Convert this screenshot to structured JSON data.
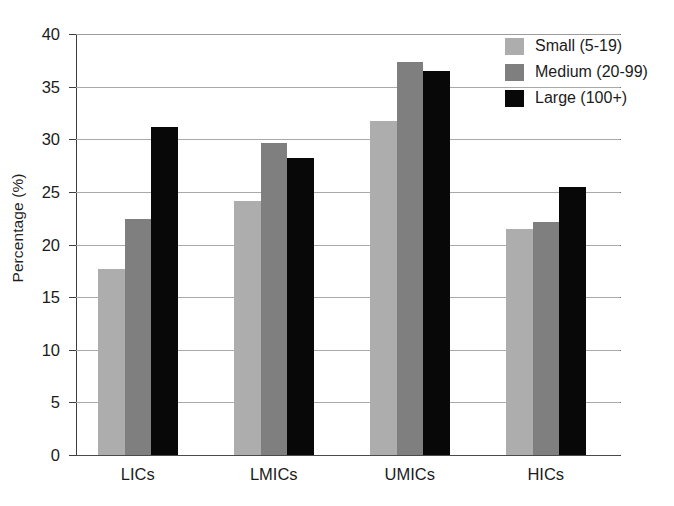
{
  "chart_data": {
    "type": "bar",
    "title": "",
    "subtitle": "",
    "xlabel": "",
    "ylabel": "Percentage (%)",
    "categories": [
      "LICs",
      "LMICs",
      "UMICs",
      "HICs"
    ],
    "series": [
      {
        "name": "Small (5-19)",
        "color": "#adadad",
        "values": [
          17.7,
          24.1,
          31.7,
          21.5
        ]
      },
      {
        "name": "Medium (20-99)",
        "color": "#7f7f7f",
        "values": [
          22.4,
          29.6,
          37.3,
          22.1
        ]
      },
      {
        "name": "Large (100+)",
        "color": "#080808",
        "values": [
          31.2,
          28.2,
          36.5,
          25.5
        ]
      }
    ],
    "ylim": [
      0,
      40
    ],
    "ytick_values": [
      0,
      5,
      10,
      15,
      20,
      25,
      30,
      35,
      40
    ],
    "ytick_labels": [
      "0",
      "5",
      "10",
      "15",
      "20",
      "25",
      "30",
      "35",
      "40"
    ],
    "grid": "horizontal",
    "legend_position": "top-right",
    "annotations": []
  },
  "legend": {
    "entries": [
      {
        "label": "Small (5-19)",
        "swatch": "legend-swatch-small"
      },
      {
        "label": "Medium (20-99)",
        "swatch": "legend-swatch-medium"
      },
      {
        "label": "Large (100+)",
        "swatch": "legend-swatch-large"
      }
    ]
  },
  "axes": {
    "y_title": "Percentage (%)",
    "y_ticks": [
      "40",
      "35",
      "30",
      "25",
      "20",
      "15",
      "10",
      "5",
      "0"
    ],
    "x_ticks": [
      "LICs",
      "LMICs",
      "UMICs",
      "HICs"
    ]
  }
}
